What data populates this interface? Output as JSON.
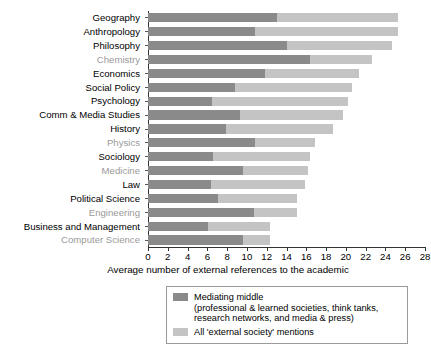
{
  "chart_data": {
    "type": "bar",
    "orientation": "horizontal",
    "stacked": true,
    "title": "",
    "xlabel": "Average number of external references to the academic",
    "ylabel": "",
    "xlim": [
      0,
      28
    ],
    "xticks": [
      0,
      2,
      4,
      6,
      8,
      10,
      12,
      14,
      16,
      18,
      20,
      22,
      24,
      26,
      28
    ],
    "grid": false,
    "legend_position": "bottom",
    "categories": [
      "Geography",
      "Anthropology",
      "Philosophy",
      "Chemistry",
      "Economics",
      "Social Policy",
      "Psychology",
      "Comm & Media Studies",
      "History",
      "Physics",
      "Sociology",
      "Medicine",
      "Law",
      "Political Science",
      "Engineering",
      "Business and Management",
      "Computer Science"
    ],
    "category_styles": [
      "dark",
      "dark",
      "dark",
      "grey",
      "dark",
      "dark",
      "dark",
      "dark",
      "dark",
      "grey",
      "dark",
      "grey",
      "dark",
      "dark",
      "grey",
      "dark",
      "grey"
    ],
    "series": [
      {
        "name": "Mediating middle",
        "color": "#8a8a8a",
        "values": [
          13.0,
          10.8,
          14.1,
          16.4,
          11.8,
          8.8,
          6.5,
          9.3,
          7.9,
          10.8,
          6.6,
          9.6,
          6.4,
          7.1,
          10.7,
          6.1,
          9.6
        ]
      },
      {
        "name": "All 'external society' mentions",
        "color": "#c4c4c4",
        "values": [
          25.3,
          25.3,
          24.7,
          22.6,
          21.3,
          20.6,
          20.2,
          19.7,
          18.7,
          16.9,
          16.4,
          16.2,
          15.9,
          15.1,
          15.1,
          12.3,
          12.3
        ]
      }
    ],
    "colors": {
      "mediating_middle": "#8a8a8a",
      "external_society": "#c4c4c4"
    }
  },
  "legend": {
    "entries": [
      {
        "label": "Mediating middle",
        "sub1": "(professional & learned societies, think tanks,",
        "sub2": "research networks, and media & press)",
        "swatch": "dark"
      },
      {
        "label": "All 'external society' mentions",
        "sub1": "",
        "sub2": "",
        "swatch": "light"
      }
    ]
  }
}
